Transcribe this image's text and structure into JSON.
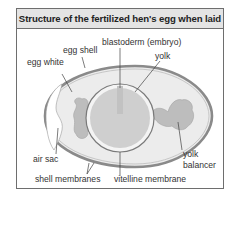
{
  "title": "Structure of the fertilized hen's egg when laid",
  "labels": {
    "egg_shell": "egg shell",
    "egg_white": "egg white",
    "blastoderm": "blastoderm (embryo)",
    "yolk": "yolk",
    "air_sac": "air sac",
    "shell_membranes": "shell membranes",
    "vitelline_membrane": "vitelline membrane",
    "yolk_balancer_line1": "yolk",
    "yolk_balancer_line2": "balancer"
  },
  "colors": {
    "shell": "#a8a8a8",
    "egg_white": "#ececec",
    "yolk": "#cfcfcf",
    "yolk_ring": "#f4f4f4",
    "balancer": "#bdbdbd",
    "title_bg": "#e4e4e4",
    "outline": "#6e6e6e"
  }
}
